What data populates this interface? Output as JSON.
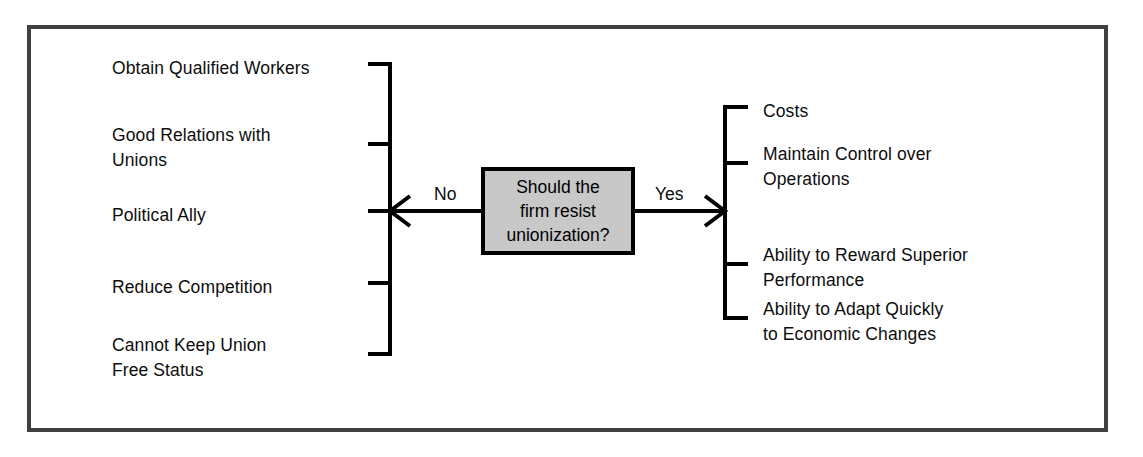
{
  "diagram": {
    "type": "decision-tree",
    "decision": {
      "text": "Should the\nfirm resist\nunionization?",
      "box_fill": "#c8c8c8",
      "box_border": "#000000"
    },
    "branches": {
      "no": {
        "label": "No",
        "side": "left",
        "items": [
          "Obtain Qualified Workers",
          "Good Relations  with\n Unions",
          "Political Ally",
          "Reduce Competition",
          "Cannot Keep Union\n Free Status"
        ]
      },
      "yes": {
        "label": "Yes",
        "side": "right",
        "items": [
          "Costs",
          "Maintain Control over\n Operations",
          "Ability to Reward Superior\n Performance",
          "Ability to Adapt Quickly\n to Economic Changes"
        ]
      }
    },
    "frame_color": "#3f3f3f",
    "line_color": "#000000",
    "background": "#ffffff"
  }
}
